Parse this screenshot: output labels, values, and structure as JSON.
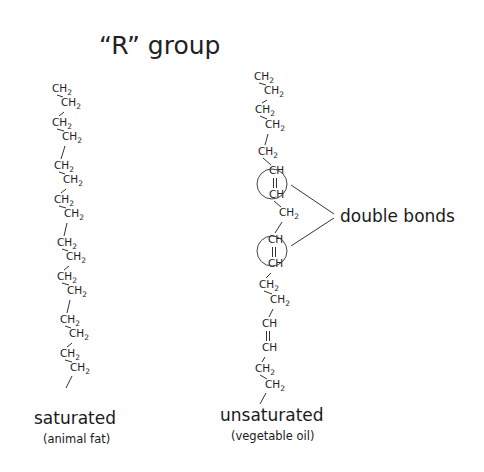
{
  "title": "“R” group",
  "saturated": {
    "label": "saturated",
    "sublabel": "(animal fat)",
    "chain": [
      "CH2",
      "CH2",
      "CH2",
      "CH2",
      "CH2",
      "CH2",
      "CH2",
      "CH2",
      "CH2",
      "CH2",
      "CH2",
      "CH2",
      "CH2",
      "CH2",
      "CH2",
      "CH2"
    ]
  },
  "unsaturated": {
    "label": "unsaturated",
    "sublabel": "(vegetable oil)",
    "chain": [
      "CH2",
      "CH2",
      "CH2",
      "CH2",
      "CH2",
      "CH",
      "CH",
      "CH2",
      "CH",
      "CH",
      "CH2",
      "CH2",
      "CH",
      "CH",
      "CH2",
      "CH2"
    ],
    "double_bond_pairs": [
      [
        5,
        6
      ],
      [
        8,
        9
      ],
      [
        12,
        13
      ]
    ],
    "circled_double_bonds": [
      [
        5,
        6
      ],
      [
        8,
        9
      ]
    ]
  },
  "annotation": {
    "label": "double bonds"
  },
  "atoms": {
    "C": "C",
    "H": "H",
    "sub2": "2"
  }
}
